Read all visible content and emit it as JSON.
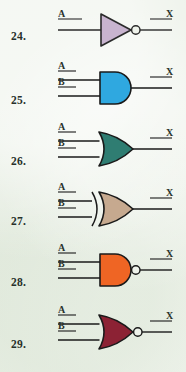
{
  "page": {
    "background_color": "#e9efe5",
    "ink_color": "#2a332c"
  },
  "problems": [
    {
      "number": "24.",
      "gate": "NOT",
      "gate_fill": "#c8b4cf",
      "gate_stroke": "#2a2a2a",
      "inverted": true,
      "inputs": [
        "A"
      ],
      "output": "X",
      "num_x": 11,
      "num_y": 31,
      "top": 0
    },
    {
      "number": "25.",
      "gate": "AND",
      "gate_fill": "#2fa8e0",
      "gate_stroke": "#1a1a1a",
      "inverted": false,
      "inputs": [
        "A",
        "B"
      ],
      "output": "X",
      "num_x": 11,
      "num_y": 95,
      "top": 58
    },
    {
      "number": "26.",
      "gate": "OR",
      "gate_fill": "#2f7d72",
      "gate_stroke": "#1a1a1a",
      "inverted": false,
      "inputs": [
        "A",
        "B"
      ],
      "output": "X",
      "num_x": 11,
      "num_y": 156,
      "top": 119
    },
    {
      "number": "27.",
      "gate": "XOR",
      "gate_fill": "#c6a98f",
      "gate_stroke": "#1a1a1a",
      "inverted": false,
      "inputs": [
        "A",
        "B"
      ],
      "output": "X",
      "num_x": 11,
      "num_y": 216,
      "top": 179
    },
    {
      "number": "28.",
      "gate": "NAND",
      "gate_fill": "#ef6524",
      "gate_stroke": "#1a1a1a",
      "inverted": true,
      "inputs": [
        "A",
        "B"
      ],
      "output": "X",
      "num_x": 11,
      "num_y": 277,
      "top": 240
    },
    {
      "number": "29.",
      "gate": "NOR",
      "gate_fill": "#8c2234",
      "gate_stroke": "#1a1a1a",
      "inverted": true,
      "inputs": [
        "A",
        "B"
      ],
      "output": "X",
      "num_x": 11,
      "num_y": 339,
      "top": 302
    }
  ]
}
